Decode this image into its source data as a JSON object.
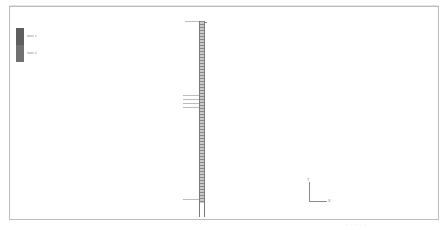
{
  "viewer": {
    "type": "structural-model-viewport",
    "background_color": "#ffffff",
    "frame_color": "#bdbdbd"
  },
  "legend": {
    "items": [
      {
        "label": "item 1",
        "color": "#5e5e5e"
      },
      {
        "label": "item 2",
        "color": "#707070"
      }
    ]
  },
  "model": {
    "structure_color": "#8a8a8a",
    "guide_color": "#bcbcbc"
  },
  "axes": {
    "y_label": "Y",
    "x_label": "X"
  },
  "status": {
    "text": "· · · · ·"
  }
}
